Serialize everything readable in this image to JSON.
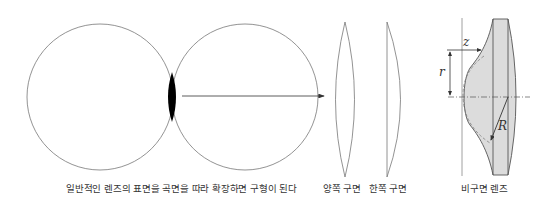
{
  "captions": {
    "sphere": "일반적인 렌즈의 표면을 곡면을 따라 확장하면 구형이 된다",
    "biconvex": "양쪽 구면",
    "planoconvex": "한쪽 구면",
    "aspheric": "비구면 렌즈"
  },
  "symbols": {
    "z": "z",
    "r": "r",
    "R": "R"
  },
  "colors": {
    "stroke": "#666666",
    "lens_fill": "#000000",
    "aspheric_fill": "#dcdcdc",
    "text": "#333333"
  }
}
